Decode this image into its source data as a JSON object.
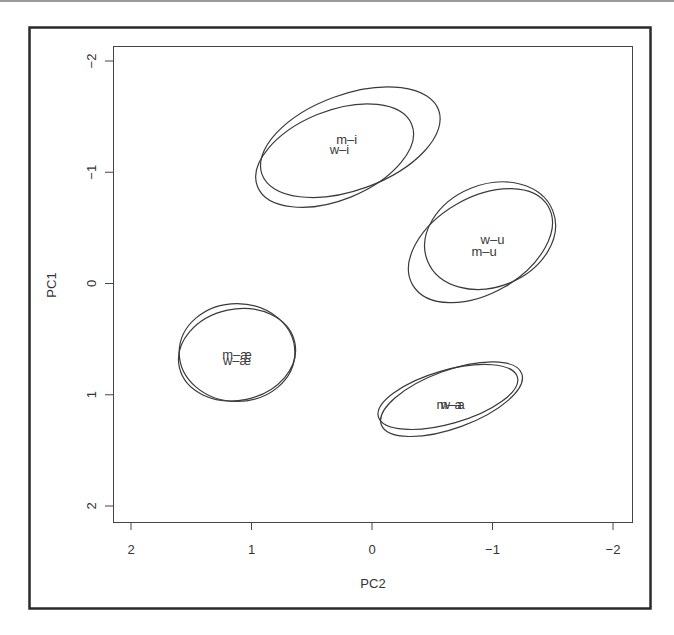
{
  "chart_data": {
    "type": "scatter",
    "title": "",
    "xlabel": "PC2",
    "ylabel": "PC1",
    "xlim": [
      2.15,
      -2.1
    ],
    "ylim": [
      -2.15,
      2.1
    ],
    "x_reversed": true,
    "y_reversed": true,
    "xticks": [
      2,
      1,
      0,
      -1,
      -2
    ],
    "xtick_labels": [
      "2",
      "1",
      "0",
      "−1",
      "−2"
    ],
    "yticks": [
      -2,
      -1,
      0,
      1,
      2
    ],
    "ytick_labels": [
      "−2",
      "−1",
      "0",
      "1",
      "2"
    ],
    "grid": false,
    "legend": null,
    "series": [
      {
        "name": "m-i",
        "x": 0.2,
        "y": -1.27,
        "ellipse": {
          "cx": 0.18,
          "cy": -1.27,
          "rx": 0.78,
          "ry": 0.43,
          "angle": -20
        }
      },
      {
        "name": "w-i",
        "x": 0.28,
        "y": -1.18,
        "ellipse": {
          "cx": 0.31,
          "cy": -1.15,
          "rx": 0.69,
          "ry": 0.4,
          "angle": -22
        }
      },
      {
        "name": "w-u",
        "x": -0.98,
        "y": -0.43,
        "ellipse": {
          "cx": -0.98,
          "cy": -0.43,
          "rx": 0.56,
          "ry": 0.46,
          "angle": -22
        }
      },
      {
        "name": "m-u",
        "x": -0.9,
        "y": -0.31,
        "ellipse": {
          "cx": -0.9,
          "cy": -0.34,
          "rx": 0.65,
          "ry": 0.43,
          "angle": -30
        }
      },
      {
        "name": "m-æ",
        "x": 1.12,
        "y": 0.6,
        "ellipse": {
          "cx": 1.12,
          "cy": 0.62,
          "rx": 0.48,
          "ry": 0.44,
          "angle": 0
        }
      },
      {
        "name": "w-æ",
        "x": 1.12,
        "y": 0.66,
        "ellipse": {
          "cx": 1.12,
          "cy": 0.64,
          "rx": 0.49,
          "ry": 0.41,
          "angle": -12
        }
      },
      {
        "name": "m-a",
        "x": -0.66,
        "y": 1.03,
        "ellipse": {
          "cx": -0.66,
          "cy": 1.04,
          "rx": 0.62,
          "ry": 0.26,
          "angle": -20
        }
      },
      {
        "name": "w-a",
        "x": -0.62,
        "y": 1.04,
        "ellipse": {
          "cx": -0.63,
          "cy": 1.02,
          "rx": 0.6,
          "ry": 0.24,
          "angle": -16
        }
      }
    ],
    "labels": [
      {
        "text": "m–i",
        "x": 0.21,
        "y": -1.3
      },
      {
        "text": "w–i",
        "x": 0.27,
        "y": -1.21
      },
      {
        "text": "w–u",
        "x": -1.0,
        "y": -0.4
      },
      {
        "text": "m–u",
        "x": -0.93,
        "y": -0.29
      },
      {
        "text": "m–æ",
        "x": 1.12,
        "y": 0.63
      },
      {
        "text": "w–æ",
        "x": 1.12,
        "y": 0.69
      },
      {
        "text": "m–a",
        "x": -0.64,
        "y": 1.08
      },
      {
        "text": "w–a",
        "x": -0.67,
        "y": 1.08
      }
    ]
  },
  "colors": {
    "stroke": "#3a3a3a",
    "frame": "#2a2a2a",
    "text": "#333333"
  }
}
